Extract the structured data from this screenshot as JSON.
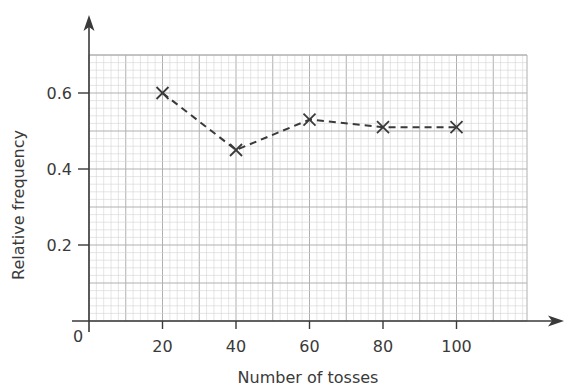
{
  "chart_data": {
    "type": "line",
    "title": "",
    "xlabel": "Number of tosses",
    "ylabel": "Relative frequency",
    "x": [
      20,
      40,
      60,
      80,
      100
    ],
    "series": [
      {
        "name": "Relative frequency",
        "values": [
          0.6,
          0.45,
          0.53,
          0.51,
          0.51
        ],
        "marker": "x",
        "line_style": "dashed"
      }
    ],
    "x_ticks": [
      20,
      40,
      60,
      80,
      100
    ],
    "x_tick_labels": [
      "20",
      "40",
      "60",
      "80",
      "100"
    ],
    "y_ticks": [
      0.2,
      0.4,
      0.6
    ],
    "y_tick_labels": [
      "0.2",
      "0.4",
      "0.6"
    ],
    "origin_label": "0",
    "xlim": [
      0,
      120
    ],
    "ylim": [
      0,
      0.7
    ],
    "grid": true,
    "grid_style": "graph paper (minor every 2 tosses / 0.02, major every 10 tosses / 0.1)",
    "legend": "none"
  },
  "colors": {
    "axis": "#3a3a3a",
    "line": "#3a3a3a",
    "grid_minor": "#d4d4d4",
    "grid_major": "#b0b0b0"
  }
}
